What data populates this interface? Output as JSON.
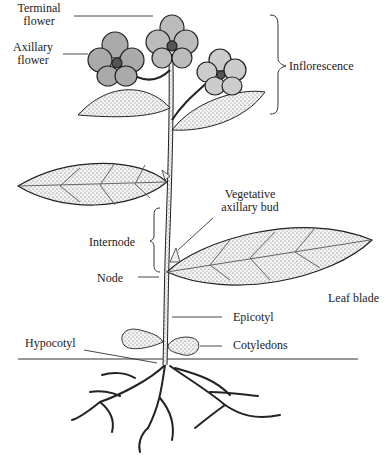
{
  "diagram": {
    "labels": {
      "terminal_flower_1": "Terminal",
      "terminal_flower_2": "flower",
      "axillary_flower_1": "Axillary",
      "axillary_flower_2": "flower",
      "inflorescence": "Inflorescence",
      "vegetative_bud_1": "Vegetative",
      "vegetative_bud_2": "axillary bud",
      "internode": "Internode",
      "node": "Node",
      "leaf_blade": "Leaf blade",
      "epicotyl": "Epicotyl",
      "hypocotyl": "Hypocotyl",
      "cotyledons": "Cotyledons"
    },
    "colors": {
      "ink": "#222222",
      "leaf_fill": "#e8e8e8",
      "background": "#ffffff"
    }
  }
}
